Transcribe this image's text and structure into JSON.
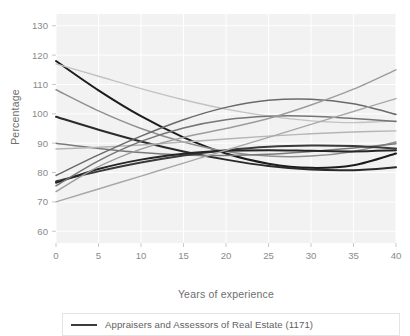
{
  "chart_data": {
    "type": "line",
    "title": "",
    "xlabel": "Years of experience",
    "ylabel": "Percentage",
    "xlim": [
      0,
      40
    ],
    "ylim": [
      56,
      134
    ],
    "xticks": [
      0,
      5,
      10,
      15,
      20,
      25,
      30,
      35,
      40
    ],
    "xticklabels": [
      "0",
      "5",
      "10",
      "15",
      "20",
      "25",
      "30",
      "35",
      "40"
    ],
    "yticks": [
      60,
      70,
      80,
      90,
      100,
      110,
      120,
      130
    ],
    "yticklabels": [
      "60",
      "70",
      "80",
      "90",
      "100",
      "110",
      "120",
      "130"
    ],
    "grid": true,
    "grid_color": "#ffffff",
    "plot_background": "#f2f2f2",
    "legend_position": "below-axes",
    "legend": [
      {
        "label": "Appraisers and Assessors of Real Estate (1171)",
        "color": "#3b3b3b"
      }
    ],
    "x": [
      0,
      5,
      10,
      15,
      20,
      25,
      30,
      35,
      40
    ],
    "series": [
      {
        "name": "series-1-dark-steep-decline",
        "color": "#1c1c1c",
        "width": 2.0,
        "values": [
          118.0,
          108.0,
          99.2,
          92.0,
          86.5,
          83.0,
          81.6,
          82.5,
          86.5
        ]
      },
      {
        "name": "series-2-light-decline",
        "color": "#c2c2c2",
        "width": 1.4,
        "values": [
          117.0,
          112.8,
          108.6,
          104.8,
          101.6,
          99.2,
          97.6,
          97.0,
          97.6
        ]
      },
      {
        "name": "series-3-medium-decline",
        "color": "#8f8f8f",
        "width": 1.5,
        "values": [
          108.2,
          101.0,
          95.0,
          90.4,
          87.2,
          85.6,
          85.6,
          87.2,
          90.4
        ]
      },
      {
        "name": "series-4-dark-gentle-decline",
        "color": "#2a2a2a",
        "width": 2.0,
        "values": [
          99.0,
          94.6,
          90.6,
          87.2,
          84.4,
          82.2,
          81.0,
          80.8,
          81.8
        ]
      },
      {
        "name": "series-5-medium-flatish",
        "color": "#7a7a7a",
        "width": 1.5,
        "values": [
          90.0,
          88.2,
          86.8,
          86.0,
          85.8,
          86.2,
          87.2,
          88.4,
          89.8
        ]
      },
      {
        "name": "series-6-light-flat",
        "color": "#b5b5b5",
        "width": 1.4,
        "values": [
          88.0,
          88.6,
          89.4,
          90.4,
          91.4,
          92.4,
          93.2,
          93.8,
          94.2
        ]
      },
      {
        "name": "series-7-medium-rise-hump",
        "color": "#6a6a6a",
        "width": 1.5,
        "values": [
          79.0,
          86.0,
          92.4,
          98.0,
          102.2,
          104.6,
          105.0,
          103.4,
          99.8
        ]
      },
      {
        "name": "series-8-dark-hump",
        "color": "#3a3a3a",
        "width": 2.0,
        "values": [
          77.0,
          80.4,
          83.4,
          85.8,
          87.6,
          88.8,
          89.2,
          89.0,
          88.2
        ]
      },
      {
        "name": "series-9-dark-dip-rise",
        "color": "#262626",
        "width": 2.0,
        "values": [
          76.5,
          81.2,
          84.4,
          86.4,
          87.4,
          87.6,
          87.4,
          87.2,
          87.6
        ]
      },
      {
        "name": "series-10-medium-steep-rise",
        "color": "#757575",
        "width": 1.5,
        "values": [
          75.5,
          84.0,
          90.6,
          95.2,
          98.0,
          99.2,
          99.2,
          98.4,
          97.4
        ]
      },
      {
        "name": "series-11-light-steep-rise",
        "color": "#9c9c9c",
        "width": 1.4,
        "values": [
          73.5,
          82.0,
          88.0,
          92.0,
          95.0,
          98.4,
          103.0,
          108.4,
          115.0
        ]
      },
      {
        "name": "series-12-light-linear-rise",
        "color": "#a8a8a8",
        "width": 1.4,
        "values": [
          70.0,
          74.4,
          78.8,
          83.2,
          87.6,
          92.0,
          96.4,
          100.8,
          105.2
        ]
      }
    ]
  }
}
